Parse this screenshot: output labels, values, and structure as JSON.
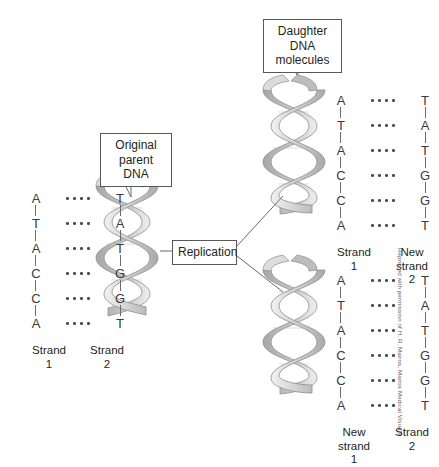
{
  "figure": {
    "background_color": "#ffffff",
    "helix_colors": {
      "ribbon_light": "#e9e9e9",
      "ribbon_mid": "#c4c4c4",
      "ribbon_dark": "#9b9b9b",
      "outline": "#8a8a8a"
    },
    "text_color": "#231f20",
    "box_border_color": "#58585a"
  },
  "callouts": {
    "parent": {
      "name": "original-parent-dna",
      "line1": "Original",
      "line2": "parent DNA"
    },
    "daughter": {
      "name": "daughter-dna-molecules",
      "line1": "Daughter DNA",
      "line2": "molecules"
    },
    "replication": {
      "name": "replication",
      "label": "Replication"
    }
  },
  "ladders": {
    "parent": {
      "id": "parent-ladder",
      "pairs": [
        {
          "left": "A",
          "right": "T"
        },
        {
          "left": "T",
          "right": "A"
        },
        {
          "left": "A",
          "right": "T"
        },
        {
          "left": "C",
          "right": "G"
        },
        {
          "left": "C",
          "right": "G"
        },
        {
          "left": "A",
          "right": "T"
        }
      ],
      "labels": {
        "left_line1": "Strand",
        "left_line2": "1",
        "right_line1": "Strand",
        "right_line2": "2"
      }
    },
    "daughter_top": {
      "id": "daughter-top-ladder",
      "pairs": [
        {
          "left": "A",
          "right": "T"
        },
        {
          "left": "T",
          "right": "A"
        },
        {
          "left": "A",
          "right": "T"
        },
        {
          "left": "C",
          "right": "G"
        },
        {
          "left": "C",
          "right": "G"
        },
        {
          "left": "A",
          "right": "T"
        }
      ],
      "labels": {
        "left_line1": "Strand",
        "left_line2": "1",
        "right_line1": "New",
        "right_line2": "strand",
        "right_line3": "2"
      }
    },
    "daughter_bottom": {
      "id": "daughter-bottom-ladder",
      "pairs": [
        {
          "left": "A",
          "right": "T"
        },
        {
          "left": "T",
          "right": "A"
        },
        {
          "left": "A",
          "right": "T"
        },
        {
          "left": "C",
          "right": "G"
        },
        {
          "left": "C",
          "right": "G"
        },
        {
          "left": "A",
          "right": "T"
        }
      ],
      "labels": {
        "left_line1": "New",
        "left_line2": "strand",
        "left_line3": "1",
        "right_line1": "Strand",
        "right_line2": "2"
      }
    }
  },
  "helices": [
    {
      "name": "parent-helix"
    },
    {
      "name": "daughter-top-helix"
    },
    {
      "name": "daughter-bottom-helix"
    }
  ],
  "credit": {
    "text": "Reprinted with permission of H. R. Mairos, Mairos Medical Visuals"
  }
}
